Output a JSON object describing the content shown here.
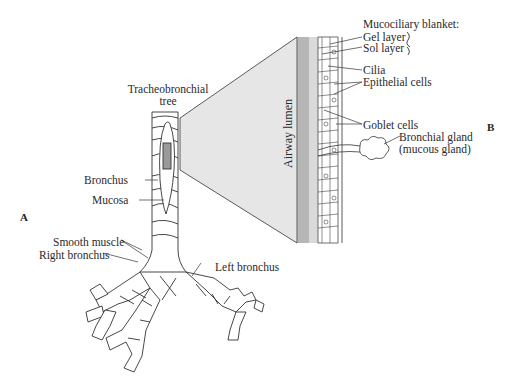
{
  "figure": {
    "panels": [
      {
        "id": "A",
        "label": "A"
      },
      {
        "id": "B",
        "label": "B"
      }
    ],
    "panel_a": {
      "title_line1": "Tracheobronchial",
      "title_line2": "tree",
      "labels": {
        "bronchus": "Bronchus",
        "mucosa": "Mucosa",
        "smooth_muscle": "Smooth muscle",
        "right_bronchus": "Right bronchus",
        "left_bronchus": "Left bronchus"
      }
    },
    "panel_b": {
      "lumen_label": "Airway lumen",
      "header": "Mucociliary blanket:",
      "labels": {
        "gel_layer": "Gel layer",
        "sol_layer": "Sol layer",
        "cilia": "Cilia",
        "epithelial_cells": "Epithelial cells",
        "goblet_cells": "Goblet cells",
        "bronchial_gland_line1": "Bronchial gland",
        "bronchial_gland_line2": "(mucous gland)"
      }
    },
    "colors": {
      "wedge_fill": "#e6e6e6",
      "line": "#333333"
    }
  }
}
